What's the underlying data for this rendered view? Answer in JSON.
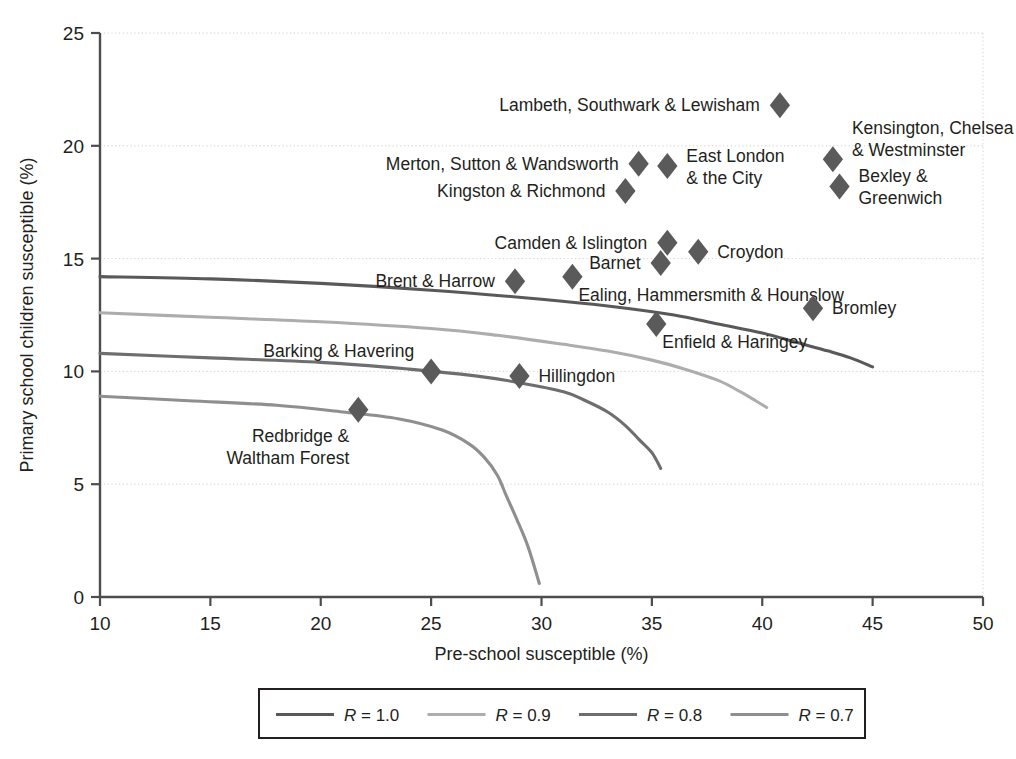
{
  "chart_data": {
    "type": "scatter",
    "title": "",
    "xlabel": "Pre-school susceptible (%)",
    "ylabel": "Primary school children susceptible (%)",
    "xlim": [
      10,
      50
    ],
    "ylim": [
      0,
      25
    ],
    "xticks": [
      10,
      15,
      20,
      25,
      30,
      35,
      40,
      45,
      50
    ],
    "yticks": [
      0,
      5,
      10,
      15,
      20,
      25
    ],
    "grid": "horizontal-dotted",
    "legend_position": "bottom",
    "marker": "diamond",
    "points": [
      {
        "label": "Lambeth, Southwark & Lewisham",
        "x": 40.8,
        "y": 21.8,
        "label_pos": "left"
      },
      {
        "label": "Kensington, Chelsea\n& Westminster",
        "x": 43.2,
        "y": 19.4,
        "label_pos": "right-top"
      },
      {
        "label": "Merton, Sutton & Wandsworth",
        "x": 34.4,
        "y": 19.2,
        "label_pos": "left"
      },
      {
        "label": "East London\n& the City",
        "x": 35.7,
        "y": 19.1,
        "label_pos": "right"
      },
      {
        "label": "Kingston & Richmond",
        "x": 33.8,
        "y": 18.0,
        "label_pos": "left"
      },
      {
        "label": "Bexley &\nGreenwich",
        "x": 43.5,
        "y": 18.2,
        "label_pos": "right"
      },
      {
        "label": "Camden & Islington",
        "x": 35.7,
        "y": 15.7,
        "label_pos": "left"
      },
      {
        "label": "Croydon",
        "x": 37.1,
        "y": 15.3,
        "label_pos": "right"
      },
      {
        "label": "Barnet",
        "x": 35.4,
        "y": 14.8,
        "label_pos": "left"
      },
      {
        "label": "Brent & Harrow",
        "x": 28.8,
        "y": 14.0,
        "label_pos": "left"
      },
      {
        "label": "Ealing, Hammersmith & Hounslow",
        "x": 31.4,
        "y": 14.2,
        "label_pos": "below-right"
      },
      {
        "label": "Bromley",
        "x": 42.3,
        "y": 12.8,
        "label_pos": "right"
      },
      {
        "label": "Enfield & Haringey",
        "x": 35.2,
        "y": 12.1,
        "label_pos": "below-right"
      },
      {
        "label": "Barking & Havering",
        "x": 25.0,
        "y": 10.0,
        "label_pos": "above-left"
      },
      {
        "label": "Hillingdon",
        "x": 29.0,
        "y": 9.8,
        "label_pos": "right"
      },
      {
        "label": "Redbridge &\nWaltham Forest",
        "x": 21.7,
        "y": 8.3,
        "label_pos": "below-left"
      }
    ],
    "curves": [
      {
        "name": "R = 1.0",
        "color": "#595959",
        "width": 3.1,
        "points": [
          [
            10,
            14.2
          ],
          [
            15,
            14.1
          ],
          [
            20,
            13.9
          ],
          [
            25,
            13.6
          ],
          [
            30,
            13.2
          ],
          [
            33,
            12.9
          ],
          [
            36,
            12.5
          ],
          [
            38,
            12.1
          ],
          [
            40,
            11.7
          ],
          [
            41.5,
            11.3
          ],
          [
            43,
            10.9
          ],
          [
            44,
            10.6
          ],
          [
            45,
            10.2
          ]
        ]
      },
      {
        "name": "R = 0.9",
        "color": "#adadad",
        "width": 3.1,
        "points": [
          [
            10,
            12.6
          ],
          [
            15,
            12.4
          ],
          [
            20,
            12.2
          ],
          [
            25,
            11.9
          ],
          [
            28,
            11.6
          ],
          [
            31,
            11.2
          ],
          [
            33,
            10.9
          ],
          [
            35,
            10.5
          ],
          [
            36.5,
            10.1
          ],
          [
            38,
            9.6
          ],
          [
            39,
            9.1
          ],
          [
            39.7,
            8.7
          ],
          [
            40.2,
            8.4
          ]
        ]
      },
      {
        "name": "R = 0.8",
        "color": "#6e6e6e",
        "width": 3.1,
        "points": [
          [
            10,
            10.8
          ],
          [
            15,
            10.6
          ],
          [
            20,
            10.4
          ],
          [
            24,
            10.1
          ],
          [
            27,
            9.8
          ],
          [
            29,
            9.5
          ],
          [
            31,
            9.1
          ],
          [
            32,
            8.7
          ],
          [
            33,
            8.2
          ],
          [
            33.8,
            7.6
          ],
          [
            34.4,
            7.0
          ],
          [
            35,
            6.4
          ],
          [
            35.4,
            5.7
          ]
        ]
      },
      {
        "name": "R = 0.7",
        "color": "#8f8f8f",
        "width": 3.1,
        "points": [
          [
            10,
            8.9
          ],
          [
            14,
            8.7
          ],
          [
            18,
            8.5
          ],
          [
            21,
            8.2
          ],
          [
            23.5,
            7.9
          ],
          [
            25.5,
            7.4
          ],
          [
            26.7,
            6.8
          ],
          [
            27.4,
            6.2
          ],
          [
            28,
            5.4
          ],
          [
            28.4,
            4.5
          ],
          [
            28.9,
            3.4
          ],
          [
            29.4,
            2.2
          ],
          [
            29.9,
            0.6
          ]
        ]
      }
    ],
    "legend": [
      {
        "label": "R = 1.0",
        "color": "#595959"
      },
      {
        "label": "R = 0.9",
        "color": "#adadad"
      },
      {
        "label": "R = 0.8",
        "color": "#6e6e6e"
      },
      {
        "label": "R = 0.7",
        "color": "#8f8f8f"
      }
    ],
    "marker_color": "#5a5a5a"
  }
}
